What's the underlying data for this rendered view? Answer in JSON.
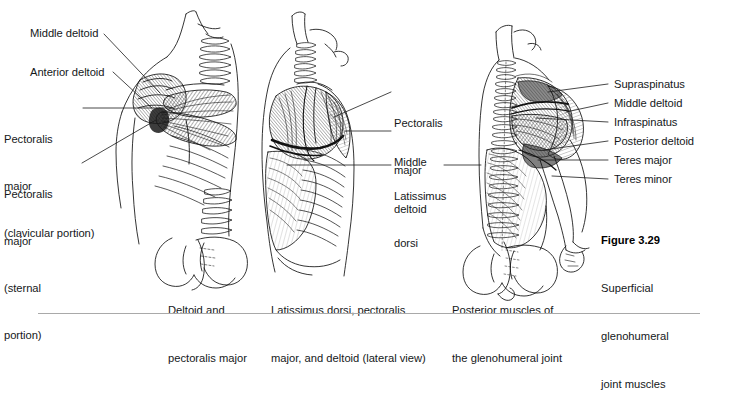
{
  "figure": {
    "number_label": "Figure 3.29",
    "title_lines": [
      "Superficial",
      "glenohumeral",
      "joint muscles"
    ]
  },
  "panels": [
    {
      "id": "anterior",
      "caption_lines": [
        "Deltoid and",
        "pectoralis major"
      ],
      "labels": [
        {
          "name": "middle-deltoid",
          "lines": [
            "Middle deltoid"
          ]
        },
        {
          "name": "anterior-deltoid",
          "lines": [
            "Anterior deltoid"
          ]
        },
        {
          "name": "pectoralis-major-clavicular",
          "lines": [
            "Pectoralis",
            "major",
            "(clavicular portion)"
          ]
        },
        {
          "name": "pectoralis-major-sternal",
          "lines": [
            "Pectoralis",
            "major",
            "(sternal",
            "portion)"
          ]
        }
      ]
    },
    {
      "id": "lateral",
      "caption_lines": [
        "Latissimus dorsi, pectoralis",
        "major, and deltoid (lateral view)"
      ],
      "labels": [
        {
          "name": "pectoralis-major",
          "lines": [
            "Pectoralis",
            "major"
          ]
        },
        {
          "name": "middle-deltoid",
          "lines": [
            "Middle",
            "deltoid"
          ]
        },
        {
          "name": "latissimus-dorsi",
          "lines": [
            "Latissimus",
            "dorsi"
          ]
        }
      ]
    },
    {
      "id": "posterior",
      "caption_lines": [
        "Posterior muscles of",
        "the glenohumeral joint"
      ],
      "labels": [
        {
          "name": "supraspinatus",
          "lines": [
            "Supraspinatus"
          ]
        },
        {
          "name": "middle-deltoid",
          "lines": [
            "Middle deltoid"
          ]
        },
        {
          "name": "infraspinatus",
          "lines": [
            "Infraspinatus"
          ]
        },
        {
          "name": "posterior-deltoid",
          "lines": [
            "Posterior deltoid"
          ]
        },
        {
          "name": "teres-major",
          "lines": [
            "Teres major"
          ]
        },
        {
          "name": "teres-minor",
          "lines": [
            "Teres minor"
          ]
        }
      ]
    }
  ],
  "colors": {
    "background": "#ffffff",
    "ink": "#15181a",
    "rule": "#a9a9a9",
    "leader": "#1a1a1a"
  }
}
